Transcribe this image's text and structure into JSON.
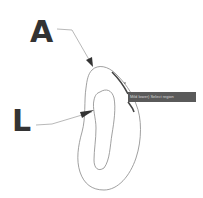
{
  "labels": {
    "a": "A",
    "l": "L"
  },
  "tooltip": {
    "text": "Mild lower) Select region"
  },
  "colors": {
    "label": "#333333",
    "outline": "#888888",
    "highlight": "#444444",
    "tooltip_bg": "#5a5a5a"
  }
}
